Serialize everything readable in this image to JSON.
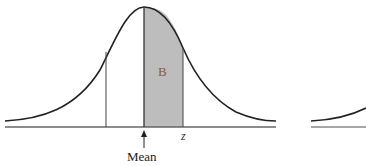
{
  "diagram": {
    "title": "",
    "labels": {
      "shaded_area": "B",
      "z_marker": "z",
      "mean_marker": "Mean"
    },
    "colors": {
      "curve": "#222222",
      "shade": "#bdbdbd",
      "baseline": "#555555",
      "b_label": "#8a5a3a"
    }
  }
}
